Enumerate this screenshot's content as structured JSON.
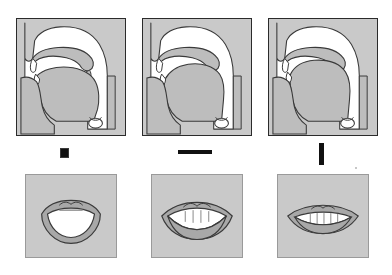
{
  "figure": {
    "columns": [
      {
        "index": "1",
        "symbol_label": "",
        "symbol_kind": "small-dark-blob-glyph",
        "tract_name": "sagittal-section-open-vowel",
        "tract_description": "Mid-sagittal section of vocal tract: low flat tongue, open jaw, raised velum",
        "lips_name": "lips-open-rounded",
        "lips_description": "Wide open mouth, jaw lowered, teeth not visible"
      },
      {
        "index": "2",
        "symbol_label": "",
        "symbol_kind": "horizontal-dark-bar-glyph",
        "tract_name": "sagittal-section-mid-vowel",
        "tract_description": "Mid-sagittal section of vocal tract: tongue bunched mid-high, moderate jaw opening",
        "lips_name": "lips-mid-spread",
        "lips_description": "Mid-open mouth, upper and lower teeth visible"
      },
      {
        "index": "3",
        "symbol_label": "",
        "symbol_kind": "tall-vertical-bar-glyph",
        "tract_name": "sagittal-section-close-front-vowel",
        "tract_description": "Mid-sagittal section of vocal tract: tongue high and front, narrow palatal constriction",
        "lips_name": "lips-narrow-spread",
        "lips_description": "Narrow spread mouth, teeth close together"
      }
    ]
  },
  "colors": {
    "page_background": "#ffffff",
    "panel_fill": "#c9c9c9",
    "tract_air_fill": "#ffffff",
    "tissue_fill": "#bdbdbd",
    "outline": "#3a3a3a",
    "box_border": "#2b2b2b",
    "symbol_ink": "#111111",
    "lip_fill": "#a8a8a8",
    "tooth_fill": "#f2f2f2",
    "mouth_cavity": "#ffffff"
  }
}
